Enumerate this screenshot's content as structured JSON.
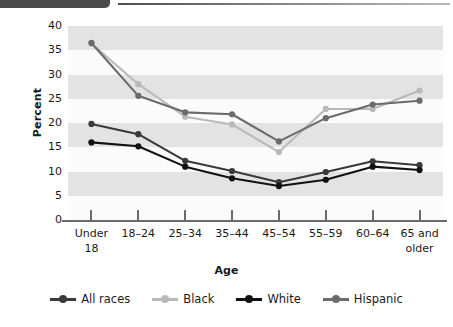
{
  "header": {
    "tab_badge": "",
    "rule": ""
  },
  "chart_data": {
    "type": "line",
    "title": "",
    "xlabel": "Age",
    "ylabel": "Percent",
    "categories": [
      "Under 18",
      "18–24",
      "25–34",
      "35–44",
      "45–54",
      "55–59",
      "60–64",
      "65 and older"
    ],
    "category_lines": [
      [
        "Under",
        "18"
      ],
      [
        "18–24",
        ""
      ],
      [
        "25–34",
        ""
      ],
      [
        "35–44",
        ""
      ],
      [
        "45–54",
        ""
      ],
      [
        "55–59",
        ""
      ],
      [
        "60–64",
        ""
      ],
      [
        "65 and",
        "older"
      ]
    ],
    "ylim": [
      0,
      40
    ],
    "yticks": [
      0,
      5,
      10,
      15,
      20,
      25,
      30,
      35,
      40
    ],
    "ytick_labels": [
      "0",
      "5",
      "10",
      "15",
      "20",
      "25",
      "30",
      "35",
      "40"
    ],
    "grid": "horizontal-bands",
    "legend_position": "bottom",
    "series": [
      {
        "name": "All races",
        "color": "#3a3a3a",
        "values": [
          19.8,
          17.7,
          12.2,
          10.1,
          7.8,
          9.9,
          12.1,
          11.3
        ]
      },
      {
        "name": "Black",
        "color": "#b9b9b9",
        "values": [
          36.4,
          28.0,
          21.3,
          19.7,
          14.0,
          22.9,
          22.9,
          26.7
        ]
      },
      {
        "name": "White",
        "color": "#111111",
        "values": [
          16.0,
          15.2,
          11.0,
          8.6,
          7.0,
          8.3,
          11.0,
          10.3
        ]
      },
      {
        "name": "Hispanic",
        "color": "#6b6b6b",
        "values": [
          36.5,
          25.6,
          22.2,
          21.8,
          16.2,
          21.0,
          23.8,
          24.6
        ]
      }
    ]
  },
  "colors": {
    "band": "#e3e3e3",
    "plot_bg": "#fbfbfb",
    "axis": "#6a6a6a",
    "text": "#1a1a1a",
    "header_tab": "#4a4a4a"
  }
}
